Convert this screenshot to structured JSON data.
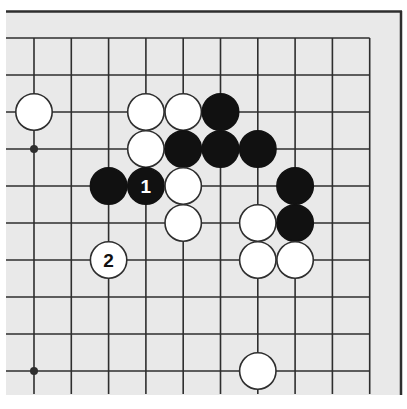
{
  "diagram": {
    "type": "go-board-fragment",
    "colors": {
      "board": "#e9e9e9",
      "line": "#2e2e2e",
      "black_stone": "#111111",
      "white_stone": "#ffffff",
      "stone_outline": "#2e2e2e",
      "label_on_black": "#ffffff",
      "label_on_white": "#111111"
    },
    "grid": {
      "cols": 10,
      "rows": 10,
      "origin_x": 34,
      "origin_y": 38,
      "spacing_x": 37.3,
      "spacing_y": 37.0,
      "top_edge_is_board_edge": true,
      "right_edge_is_board_edge": true
    },
    "star_points": [
      {
        "col": 0,
        "row": 3
      },
      {
        "col": 0,
        "row": 9
      }
    ],
    "stones": [
      {
        "color": "white",
        "col": 0,
        "row": 2
      },
      {
        "color": "white",
        "col": 3,
        "row": 2
      },
      {
        "color": "white",
        "col": 4,
        "row": 2
      },
      {
        "color": "black",
        "col": 5,
        "row": 2
      },
      {
        "color": "white",
        "col": 3,
        "row": 3
      },
      {
        "color": "black",
        "col": 4,
        "row": 3
      },
      {
        "color": "black",
        "col": 5,
        "row": 3
      },
      {
        "color": "black",
        "col": 6,
        "row": 3
      },
      {
        "color": "black",
        "col": 2,
        "row": 4
      },
      {
        "color": "black",
        "col": 3,
        "row": 4,
        "label": "1"
      },
      {
        "color": "white",
        "col": 4,
        "row": 4
      },
      {
        "color": "black",
        "col": 7,
        "row": 4
      },
      {
        "color": "white",
        "col": 4,
        "row": 5
      },
      {
        "color": "white",
        "col": 6,
        "row": 5
      },
      {
        "color": "black",
        "col": 7,
        "row": 5
      },
      {
        "color": "white",
        "col": 2,
        "row": 6,
        "label": "2"
      },
      {
        "color": "white",
        "col": 6,
        "row": 6
      },
      {
        "color": "white",
        "col": 7,
        "row": 6
      },
      {
        "color": "white",
        "col": 6,
        "row": 9
      }
    ],
    "move_labels": {
      "move_1": "1",
      "move_2": "2"
    }
  }
}
